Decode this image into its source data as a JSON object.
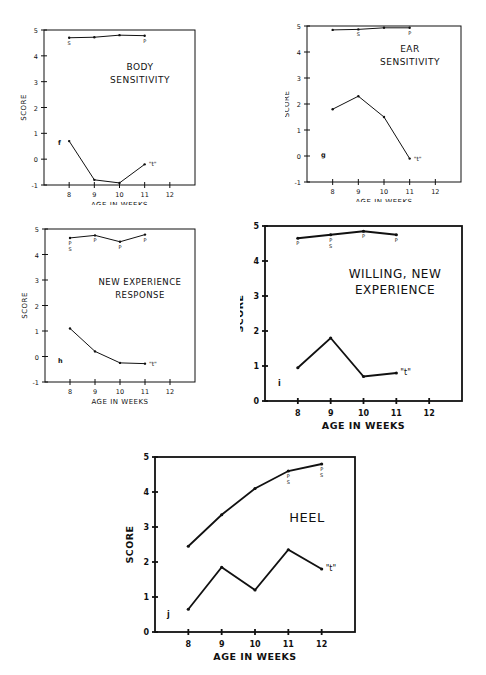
{
  "chart_data": [
    {
      "id": "f",
      "type": "line",
      "title": "BODY SENSITIVITY",
      "panel_letter": "f",
      "xlabel": "AGE IN WEEKS",
      "ylabel": "SCORE",
      "x_ticks": [
        8,
        9,
        10,
        11,
        12
      ],
      "y_ticks": [
        -1,
        0,
        1,
        2,
        3,
        4,
        5
      ],
      "ylim": [
        -1,
        5
      ],
      "xlim": [
        7.0,
        13.0
      ],
      "series": [
        {
          "name": "score",
          "x": [
            8,
            9,
            10,
            11
          ],
          "values": [
            4.7,
            4.72,
            4.8,
            4.78
          ],
          "annotations": [
            {
              "x": 8,
              "label": "S"
            },
            {
              "x": 11,
              "label": "P"
            }
          ]
        },
        {
          "name": "t",
          "x": [
            8,
            9,
            10,
            11
          ],
          "values": [
            0.7,
            -0.8,
            -0.92,
            -0.2
          ],
          "end_label": "\"t\""
        }
      ]
    },
    {
      "id": "g",
      "type": "line",
      "title": "EAR SENSITIVITY",
      "panel_letter": "g",
      "xlabel": "AGE IN WEEKS",
      "ylabel": "SCORE",
      "x_ticks": [
        8,
        9,
        10,
        11,
        12
      ],
      "y_ticks": [
        -1,
        0,
        1,
        2,
        3,
        4,
        5
      ],
      "ylim": [
        -1,
        5
      ],
      "xlim": [
        7.0,
        13.0
      ],
      "series": [
        {
          "name": "score",
          "x": [
            8,
            9,
            10,
            11
          ],
          "values": [
            4.85,
            4.87,
            4.93,
            4.93
          ],
          "annotations": [
            {
              "x": 9,
              "label": "S"
            },
            {
              "x": 11,
              "label": "P"
            }
          ]
        },
        {
          "name": "t",
          "x": [
            8,
            9,
            10,
            11
          ],
          "values": [
            1.8,
            2.3,
            1.5,
            -0.1
          ],
          "end_label": "\"t\""
        }
      ]
    },
    {
      "id": "h",
      "type": "line",
      "title": "NEW EXPERIENCE RESPONSE",
      "panel_letter": "h",
      "xlabel": "AGE IN WEEKS",
      "ylabel": "SCORE",
      "x_ticks": [
        8,
        9,
        10,
        11,
        12
      ],
      "y_ticks": [
        -1,
        0,
        1,
        2,
        3,
        4,
        5
      ],
      "ylim": [
        -1,
        5
      ],
      "xlim": [
        7.0,
        13.0
      ],
      "series": [
        {
          "name": "score",
          "x": [
            8,
            9,
            10,
            11
          ],
          "values": [
            4.65,
            4.75,
            4.5,
            4.78
          ],
          "annotations": [
            {
              "x": 8,
              "label": "P S"
            },
            {
              "x": 9,
              "label": "P"
            },
            {
              "x": 10,
              "label": "P"
            },
            {
              "x": 11,
              "label": "P"
            }
          ]
        },
        {
          "name": "t",
          "x": [
            8,
            9,
            10,
            11
          ],
          "values": [
            1.1,
            0.2,
            -0.25,
            -0.28
          ],
          "end_label": "\"t\""
        }
      ]
    },
    {
      "id": "i",
      "type": "line",
      "title": "WILLING, NEW EXPERIENCE",
      "panel_letter": "i",
      "xlabel": "AGE IN WEEKS",
      "ylabel": "SCORE",
      "x_ticks": [
        8,
        9,
        10,
        11,
        12
      ],
      "y_ticks": [
        0,
        1,
        2,
        3,
        4,
        5
      ],
      "ylim": [
        0,
        5
      ],
      "xlim": [
        7.0,
        13.0
      ],
      "series": [
        {
          "name": "score",
          "x": [
            8,
            9,
            10,
            11
          ],
          "values": [
            4.65,
            4.75,
            4.85,
            4.75
          ],
          "annotations": [
            {
              "x": 8,
              "label": "P"
            },
            {
              "x": 9,
              "label": "P S"
            },
            {
              "x": 10,
              "label": "P"
            },
            {
              "x": 11,
              "label": "P"
            }
          ]
        },
        {
          "name": "t",
          "x": [
            8,
            9,
            10,
            11
          ],
          "values": [
            0.95,
            1.8,
            0.7,
            0.8
          ],
          "end_label": "\"t\""
        }
      ]
    },
    {
      "id": "j",
      "type": "line",
      "title": "HEEL",
      "panel_letter": "j",
      "xlabel": "AGE IN WEEKS",
      "ylabel": "SCORE",
      "x_ticks": [
        8,
        9,
        10,
        11,
        12
      ],
      "y_ticks": [
        0,
        1,
        2,
        3,
        4,
        5
      ],
      "ylim": [
        0,
        5
      ],
      "xlim": [
        7.0,
        13.0
      ],
      "series": [
        {
          "name": "score",
          "x": [
            8,
            9,
            10,
            11,
            12
          ],
          "values": [
            2.45,
            3.35,
            4.1,
            4.6,
            4.8
          ],
          "annotations": [
            {
              "x": 11,
              "label": "P S"
            },
            {
              "x": 12,
              "label": "P S"
            }
          ]
        },
        {
          "name": "t",
          "x": [
            8,
            9,
            10,
            11,
            12
          ],
          "values": [
            0.65,
            1.85,
            1.2,
            2.35,
            1.8
          ],
          "end_label": "\"t\""
        }
      ]
    }
  ],
  "layout": [
    {
      "id": "f",
      "left": 20,
      "top": 25,
      "width": 190,
      "height": 180,
      "box": {
        "x0": 24,
        "y0": 5,
        "x1": 175,
        "y1": 160
      },
      "title_lines": [
        "BODY",
        "SENSITIVITY"
      ],
      "title_x": 120,
      "title_y": 45,
      "title_size": 9,
      "panel_x": 38,
      "panel_y": 120,
      "stroke": 1
    },
    {
      "id": "g",
      "left": 285,
      "top": 22,
      "width": 190,
      "height": 180,
      "box": {
        "x0": 22,
        "y0": 4,
        "x1": 176,
        "y1": 160
      },
      "title_lines": [
        "EAR",
        "SENSITIVITY"
      ],
      "title_x": 125,
      "title_y": 30,
      "title_size": 9,
      "panel_x": 36,
      "panel_y": 135,
      "stroke": 1
    },
    {
      "id": "h",
      "left": 20,
      "top": 225,
      "width": 190,
      "height": 180,
      "box": {
        "x0": 25,
        "y0": 4,
        "x1": 175,
        "y1": 157
      },
      "title_lines": [
        "NEW EXPERIENCE",
        "RESPONSE"
      ],
      "title_x": 120,
      "title_y": 60,
      "title_size": 8.5,
      "panel_x": 38,
      "panel_y": 138,
      "stroke": 1
    },
    {
      "id": "i",
      "left": 240,
      "top": 218,
      "width": 240,
      "height": 218,
      "box": {
        "x0": 25,
        "y0": 8,
        "x1": 222,
        "y1": 183
      },
      "title_lines": [
        "WILLING, NEW",
        "EXPERIENCE"
      ],
      "title_x": 155,
      "title_y": 60,
      "title_size": 12,
      "panel_x": 38,
      "panel_y": 168,
      "stroke": 1.8
    },
    {
      "id": "j",
      "left": 125,
      "top": 447,
      "width": 245,
      "height": 228,
      "box": {
        "x0": 30,
        "y0": 10,
        "x1": 230,
        "y1": 185
      },
      "title_lines": [
        "HEEL"
      ],
      "title_x": 182,
      "title_y": 75,
      "title_size": 13,
      "panel_x": 42,
      "panel_y": 170,
      "stroke": 1.8
    }
  ]
}
